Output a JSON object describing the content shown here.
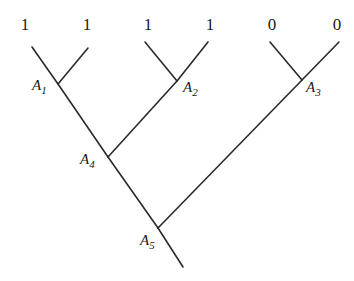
{
  "diagram": {
    "type": "binary-tree",
    "leaves": [
      {
        "value": "1",
        "x": 25,
        "y": 30
      },
      {
        "value": "1",
        "x": 87,
        "y": 30
      },
      {
        "value": "1",
        "x": 148,
        "y": 30
      },
      {
        "value": "1",
        "x": 210,
        "y": 30
      },
      {
        "value": "0",
        "x": 272,
        "y": 30
      },
      {
        "value": "0",
        "x": 337,
        "y": 30
      }
    ],
    "nodes": [
      {
        "letter": "A",
        "sub": "1",
        "x": 32,
        "y": 90
      },
      {
        "letter": "A",
        "sub": "2",
        "x": 183,
        "y": 92
      },
      {
        "letter": "A",
        "sub": "3",
        "x": 306,
        "y": 92
      },
      {
        "letter": "A",
        "sub": "4",
        "x": 80,
        "y": 164
      },
      {
        "letter": "A",
        "sub": "5",
        "x": 140,
        "y": 245
      }
    ],
    "edges": [
      [
        32,
        47,
        58,
        84
      ],
      [
        88,
        48,
        58,
        84
      ],
      [
        58,
        84,
        108,
        157
      ],
      [
        145,
        42,
        177,
        81
      ],
      [
        208,
        42,
        177,
        81
      ],
      [
        177,
        81,
        108,
        157
      ],
      [
        270,
        42,
        302,
        80
      ],
      [
        339,
        42,
        302,
        80
      ],
      [
        302,
        80,
        158,
        228
      ],
      [
        108,
        157,
        158,
        228
      ],
      [
        158,
        228,
        183,
        267
      ]
    ]
  }
}
